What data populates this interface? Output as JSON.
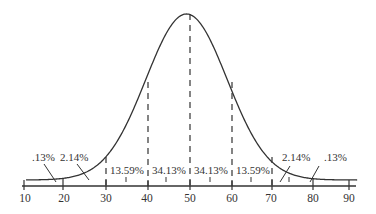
{
  "chart_data": {
    "type": "line",
    "title": "",
    "subtitle": "",
    "xlabel": "",
    "ylabel": "",
    "xlim": [
      10,
      90
    ],
    "x_ticks": [
      10,
      20,
      30,
      40,
      50,
      60,
      70,
      80,
      90
    ],
    "minor_ticks": [
      15,
      25,
      35,
      45,
      55,
      65,
      75,
      85
    ],
    "grid": false,
    "legend": null,
    "mean": 50,
    "sd": 10,
    "dashed_lines_at": [
      30,
      40,
      50,
      60,
      70
    ],
    "bands": [
      {
        "from": 10,
        "to": 20,
        "label": ".13%",
        "value": 0.13
      },
      {
        "from": 20,
        "to": 30,
        "label": "2.14%",
        "value": 2.14
      },
      {
        "from": 30,
        "to": 40,
        "label": "13.59%",
        "value": 13.59
      },
      {
        "from": 40,
        "to": 50,
        "label": "34.13%",
        "value": 34.13
      },
      {
        "from": 50,
        "to": 60,
        "label": "34.13%",
        "value": 34.13
      },
      {
        "from": 60,
        "to": 70,
        "label": "13.59%",
        "value": 13.59
      },
      {
        "from": 70,
        "to": 80,
        "label": "2.14%",
        "value": 2.14
      },
      {
        "from": 80,
        "to": 90,
        "label": ".13%",
        "value": 0.13
      }
    ],
    "colors": {
      "line": "#333333",
      "text": "#333333",
      "background": "#ffffff"
    }
  },
  "labels": {
    "band_left_outer": ".13%",
    "band_left_tail": "2.14%",
    "band_left_mid": "13.59%",
    "band_left_center": "34.13%",
    "band_right_center": "34.13%",
    "band_right_mid": "13.59%",
    "band_right_tail": "2.14%",
    "band_right_outer": ".13%"
  },
  "axis": {
    "tick_labels": [
      "10",
      "20",
      "30",
      "40",
      "50",
      "60",
      "70",
      "80",
      "90"
    ]
  }
}
